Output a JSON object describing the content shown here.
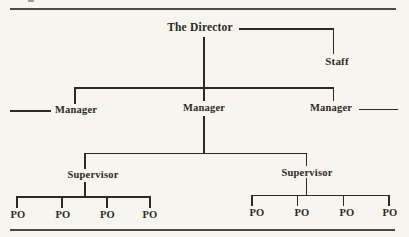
{
  "page": {
    "background": "#f7f5ef",
    "ink": "#2d2a24",
    "rule_color": "#4e4a42"
  },
  "org_chart": {
    "type": "organization-chart",
    "root": {
      "label": "The Director"
    },
    "staff": {
      "label": "Staff"
    },
    "managers": [
      {
        "label": "Manager",
        "position": "left"
      },
      {
        "label": "Manager",
        "position": "center"
      },
      {
        "label": "Manager",
        "position": "right"
      }
    ],
    "supervisors": [
      {
        "label": "Supervisor",
        "position": "left"
      },
      {
        "label": "Supervisor",
        "position": "right"
      }
    ],
    "po_left": [
      "PO",
      "PO",
      "PO",
      "PO"
    ],
    "po_right": [
      "PO",
      "PO",
      "PO",
      "PO"
    ]
  }
}
